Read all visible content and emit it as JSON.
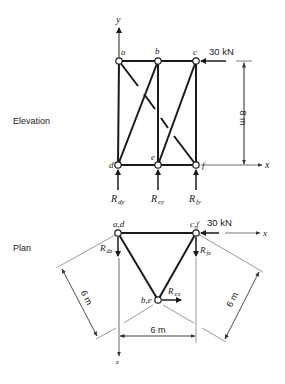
{
  "views": {
    "elevation_label": "Elevation",
    "plan_label": "Plan"
  },
  "elevation": {
    "axis_y": "y",
    "axis_x": "x",
    "nodes": {
      "a": "a",
      "b": "b",
      "c": "c",
      "d": "d",
      "e": "e",
      "f": "f"
    },
    "load": "30 kN",
    "height_dim": "8 m",
    "reactions": {
      "d": {
        "main": "R",
        "sub": "dy"
      },
      "e": {
        "main": "R",
        "sub": "ey"
      },
      "f": {
        "main": "R",
        "sub": "fy"
      }
    }
  },
  "plan": {
    "nodes": {
      "ad": "a,d",
      "cf": "c,f",
      "be": "b,e"
    },
    "load": "30 kN",
    "axis_x": "x",
    "axis_z": "z",
    "dims": {
      "left": "6 m",
      "right": "6 m",
      "bottom": "6 m"
    },
    "reactions": {
      "dz": {
        "main": "R",
        "sub": "dz"
      },
      "fz": {
        "main": "R",
        "sub": "fz"
      },
      "ex": {
        "main": "R",
        "sub": "ex"
      }
    }
  },
  "colors": {
    "line": "#1a1a1a",
    "thin": "#444444"
  }
}
